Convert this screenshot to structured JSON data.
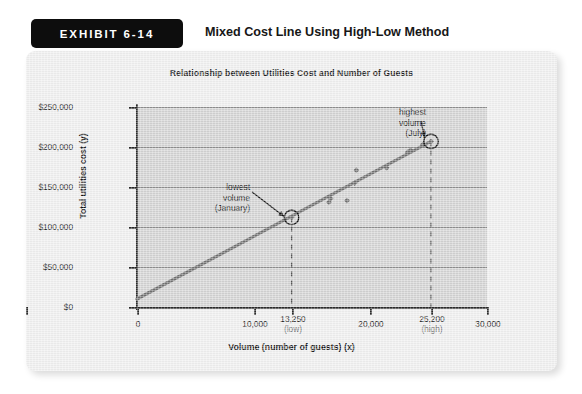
{
  "exhibit": {
    "badge_label": "EXHIBIT 6-14",
    "title": "Mixed Cost Line Using High-Low Method"
  },
  "chart_data": {
    "type": "scatter",
    "title": "Relationship between Utilities Cost and Number of Guests",
    "xlabel": "Volume (number of guests) (x)",
    "ylabel": "Total utilities cost (y)",
    "xlim": [
      0,
      30000
    ],
    "ylim": [
      0,
      250000
    ],
    "grid": true,
    "legend": "none",
    "x_ticks": [
      {
        "value": 0,
        "label": "0",
        "sub": ""
      },
      {
        "value": 10000,
        "label": "10,000",
        "sub": ""
      },
      {
        "value": 13250,
        "label": "13,250",
        "sub": "(low)"
      },
      {
        "value": 20000,
        "label": "20,000",
        "sub": ""
      },
      {
        "value": 25200,
        "label": "25,200",
        "sub": "(high)"
      },
      {
        "value": 30000,
        "label": "30,000",
        "sub": ""
      }
    ],
    "y_ticks": [
      {
        "value": 0,
        "label": "$0"
      },
      {
        "value": 50000,
        "label": "$50,000"
      },
      {
        "value": 100000,
        "label": "$100,000"
      },
      {
        "value": 150000,
        "label": "$150,000"
      },
      {
        "value": 200000,
        "label": "$200,000"
      },
      {
        "value": 250000,
        "label": "$250,000"
      }
    ],
    "series": [
      {
        "name": "Monthly observations",
        "type": "scatter",
        "marker": "diamond",
        "color": "#6f6f6f",
        "points": [
          {
            "x": 13250,
            "y": 112000
          },
          {
            "x": 16450,
            "y": 131000
          },
          {
            "x": 16600,
            "y": 135500
          },
          {
            "x": 18000,
            "y": 133000
          },
          {
            "x": 18650,
            "y": 155000
          },
          {
            "x": 18800,
            "y": 171000
          },
          {
            "x": 21400,
            "y": 174000
          },
          {
            "x": 23200,
            "y": 193500
          },
          {
            "x": 23450,
            "y": 196000
          },
          {
            "x": 24500,
            "y": 203000
          },
          {
            "x": 25200,
            "y": 207000
          }
        ]
      },
      {
        "name": "High-low cost line",
        "type": "line",
        "color": "#707070",
        "from": {
          "x": 0,
          "y": 10000
        },
        "to": {
          "x": 25200,
          "y": 207000
        }
      }
    ],
    "highlighted_points": [
      {
        "id": "low",
        "label": "lowest\nvolume\n(January)",
        "label_lines": [
          "lowest",
          "volume",
          "(January)"
        ],
        "x": 13250,
        "y": 112000,
        "drop_line": true
      },
      {
        "id": "high",
        "label": "highest\nvolume\n(July)",
        "label_lines": [
          "highest",
          "volume",
          "(July)"
        ],
        "x": 25200,
        "y": 207000,
        "drop_line": true
      }
    ],
    "colors": {
      "panel": "#d2d2d2",
      "card": "#efefef",
      "gridline": "#8e8e8e",
      "axis": "#2b2b2b",
      "line": "#707070",
      "marker": "#6f6f6f",
      "badge": "#0d0d0d"
    }
  }
}
